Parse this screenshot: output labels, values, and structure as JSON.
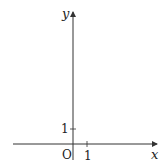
{
  "diagram": {
    "type": "coordinate-axes",
    "x_axis_label": "x",
    "y_axis_label": "y",
    "origin_label": "O",
    "x_tick_label": "1",
    "y_tick_label": "1",
    "axis_color": "#333333"
  }
}
